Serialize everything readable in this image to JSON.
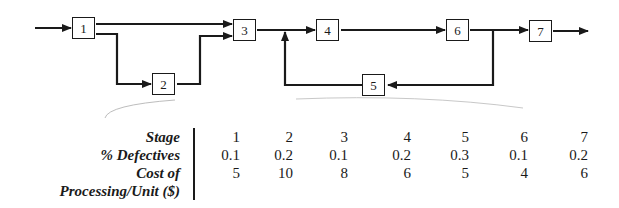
{
  "diagram": {
    "nodes": [
      {
        "id": "1",
        "label": "1"
      },
      {
        "id": "2",
        "label": "2"
      },
      {
        "id": "3",
        "label": "3"
      },
      {
        "id": "4",
        "label": "4"
      },
      {
        "id": "5",
        "label": "5"
      },
      {
        "id": "6",
        "label": "6"
      },
      {
        "id": "7",
        "label": "7"
      }
    ],
    "edges": [
      {
        "from": "input",
        "to": "1"
      },
      {
        "from": "1",
        "to": "3"
      },
      {
        "from": "1",
        "to": "2"
      },
      {
        "from": "2",
        "to": "3"
      },
      {
        "from": "3",
        "to": "4"
      },
      {
        "from": "4",
        "to": "6"
      },
      {
        "from": "6",
        "to": "7"
      },
      {
        "from": "6",
        "to": "5"
      },
      {
        "from": "5",
        "to": "4-input"
      },
      {
        "from": "7",
        "to": "output"
      }
    ],
    "colors": {
      "line": "#1a1a1a",
      "background": "#ffffff"
    }
  },
  "table": {
    "row_labels": {
      "stage": "Stage",
      "defectives": "% Defectives",
      "cost_line1": "Cost of",
      "cost_line2": "Processing/Unit ($)"
    },
    "stage": [
      "1",
      "2",
      "3",
      "4",
      "5",
      "6",
      "7"
    ],
    "defectives": [
      "0.1",
      "0.2",
      "0.1",
      "0.2",
      "0.3",
      "0.1",
      "0.2"
    ],
    "cost": [
      "5",
      "10",
      "8",
      "6",
      "5",
      "4",
      "6"
    ]
  }
}
